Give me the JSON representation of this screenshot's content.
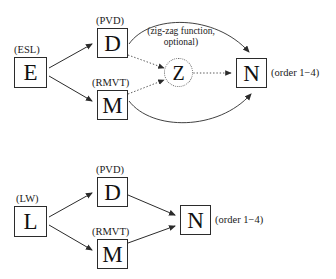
{
  "figure": {
    "title": "",
    "diagrams": [
      {
        "id": "top-diagram",
        "nodes": [
          {
            "id": "E",
            "letter": "E",
            "tag": "(ESL)",
            "shape": "box"
          },
          {
            "id": "D",
            "letter": "D",
            "tag": "(PVD)",
            "shape": "box"
          },
          {
            "id": "M",
            "letter": "M",
            "tag": "(RMVT)",
            "shape": "box"
          },
          {
            "id": "Z",
            "letter": "Z",
            "tag": "",
            "shape": "dotted-circle"
          },
          {
            "id": "N",
            "letter": "N",
            "tag": "",
            "shape": "box",
            "side_label": "(order 1−4)"
          }
        ],
        "annotation": {
          "line1": "(zig-zag function,",
          "line2": "optional)"
        },
        "edges": [
          {
            "from": "E",
            "to": "D",
            "style": "solid"
          },
          {
            "from": "E",
            "to": "M",
            "style": "solid"
          },
          {
            "from": "D",
            "to": "Z",
            "style": "dotted"
          },
          {
            "from": "M",
            "to": "Z",
            "style": "dotted"
          },
          {
            "from": "Z",
            "to": "N",
            "style": "dotted"
          },
          {
            "from": "D",
            "to": "N",
            "style": "solid-arc-top"
          },
          {
            "from": "M",
            "to": "N",
            "style": "solid-arc-bottom"
          }
        ]
      },
      {
        "id": "bottom-diagram",
        "nodes": [
          {
            "id": "L",
            "letter": "L",
            "tag": "(LW)",
            "shape": "box"
          },
          {
            "id": "D2",
            "letter": "D",
            "tag": "(PVD)",
            "shape": "box"
          },
          {
            "id": "M2",
            "letter": "M",
            "tag": "(RMVT)",
            "shape": "box"
          },
          {
            "id": "N2",
            "letter": "N",
            "tag": "",
            "shape": "box",
            "side_label": "(order 1−4)"
          }
        ],
        "edges": [
          {
            "from": "L",
            "to": "D2",
            "style": "solid"
          },
          {
            "from": "L",
            "to": "M2",
            "style": "solid"
          },
          {
            "from": "D2",
            "to": "N2",
            "style": "solid"
          },
          {
            "from": "M2",
            "to": "N2",
            "style": "solid"
          }
        ]
      }
    ],
    "colors": {
      "stroke": "#2b2b2b",
      "dotted_stroke": "#6f6f6f",
      "text": "#111111",
      "background": "#ffffff"
    }
  }
}
